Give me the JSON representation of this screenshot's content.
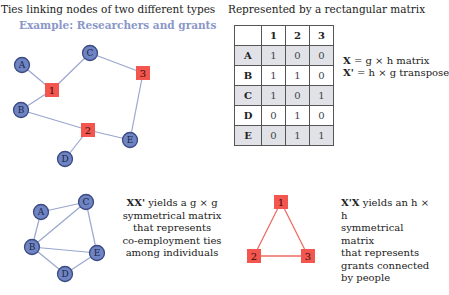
{
  "left_header": {
    "title": "Ties linking nodes of two different types",
    "subtitle": "Example: Researchers and grants"
  },
  "right_header": {
    "title": "Represented by a rectangular matrix"
  },
  "colors": {
    "person_node": "#6f84c2",
    "person_border": "#3b4a82",
    "grant_node": "#f2564f",
    "bipartite_edge": "#9aa6cf",
    "person_edge": "#9aa6cf",
    "grant_edge": "#ef6a63"
  },
  "bipartite_graph": {
    "people": [
      {
        "id": "A",
        "x": 22,
        "y": 65
      },
      {
        "id": "B",
        "x": 21,
        "y": 110
      },
      {
        "id": "C",
        "x": 90,
        "y": 53
      },
      {
        "id": "D",
        "x": 65,
        "y": 159
      },
      {
        "id": "E",
        "x": 130,
        "y": 140
      }
    ],
    "grants": [
      {
        "id": "1",
        "x": 52,
        "y": 90
      },
      {
        "id": "2",
        "x": 88,
        "y": 130
      },
      {
        "id": "3",
        "x": 143,
        "y": 73
      }
    ],
    "edges": [
      [
        "A",
        "1"
      ],
      [
        "B",
        "1"
      ],
      [
        "C",
        "1"
      ],
      [
        "B",
        "2"
      ],
      [
        "D",
        "2"
      ],
      [
        "E",
        "2"
      ],
      [
        "C",
        "3"
      ],
      [
        "E",
        "3"
      ]
    ]
  },
  "matrix": {
    "columns": [
      "1",
      "2",
      "3"
    ],
    "rows": [
      {
        "label": "A",
        "values": [
          "1",
          "0",
          "0"
        ]
      },
      {
        "label": "B",
        "values": [
          "1",
          "1",
          "0"
        ]
      },
      {
        "label": "C",
        "values": [
          "1",
          "0",
          "1"
        ]
      },
      {
        "label": "D",
        "values": [
          "0",
          "1",
          "0"
        ]
      },
      {
        "label": "E",
        "values": [
          "0",
          "1",
          "1"
        ]
      }
    ]
  },
  "equations": {
    "x_def_bold": "X",
    "x_def_rest": " = g × h matrix",
    "xt_def_bold": "X'",
    "xt_def_rest": " = h × g transpose"
  },
  "person_graph": {
    "nodes": [
      {
        "id": "A",
        "x": 41,
        "y": 212
      },
      {
        "id": "B",
        "x": 32,
        "y": 247
      },
      {
        "id": "C",
        "x": 86,
        "y": 202
      },
      {
        "id": "D",
        "x": 65,
        "y": 274
      },
      {
        "id": "E",
        "x": 97,
        "y": 253
      }
    ],
    "edges": [
      [
        "A",
        "C"
      ],
      [
        "A",
        "B"
      ],
      [
        "B",
        "C"
      ],
      [
        "C",
        "E"
      ],
      [
        "B",
        "E"
      ],
      [
        "B",
        "D"
      ],
      [
        "D",
        "E"
      ]
    ]
  },
  "person_desc": {
    "bold": "XX'",
    "line1_rest": " yields a g × g",
    "line2": "symmetrical matrix",
    "line3": "that represents",
    "line4": "co-employment ties",
    "line5": "among individuals"
  },
  "grant_graph": {
    "nodes": [
      {
        "id": "1",
        "x": 281,
        "y": 202
      },
      {
        "id": "2",
        "x": 254,
        "y": 256
      },
      {
        "id": "3",
        "x": 308,
        "y": 256
      }
    ],
    "edges": [
      [
        "1",
        "2"
      ],
      [
        "1",
        "3"
      ],
      [
        "2",
        "3"
      ]
    ]
  },
  "grant_desc": {
    "bold": "X'X",
    "line1_rest": " yields an h × h",
    "line2": "symmetrical matrix",
    "line3": "that represents",
    "line4": "grants connected",
    "line5": "by people"
  }
}
